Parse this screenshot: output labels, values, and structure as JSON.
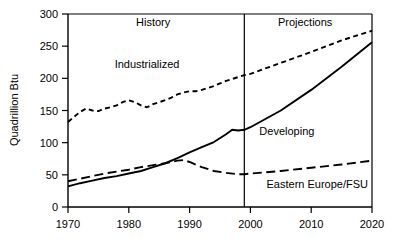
{
  "chart_data": {
    "type": "line",
    "title": "",
    "xlabel": "",
    "ylabel": "Quadrillion Btu",
    "xlim": [
      1970,
      2020
    ],
    "ylim": [
      0,
      300
    ],
    "grid": false,
    "legend_position": "inline-annotations",
    "xticks": [
      "1970",
      "1980",
      "1990",
      "2000",
      "2010",
      "2020"
    ],
    "xtick_values": [
      1970,
      1980,
      1990,
      2000,
      2010,
      2020
    ],
    "yticks": [
      "0",
      "50",
      "100",
      "150",
      "200",
      "250",
      "300"
    ],
    "ytick_values": [
      0,
      50,
      100,
      150,
      200,
      250,
      300
    ],
    "annotations": [
      {
        "text": "History",
        "x": 1984,
        "y": 288
      },
      {
        "text": "Projections",
        "x": 2009,
        "y": 288
      },
      {
        "text": "Industrialized",
        "x": 1983,
        "y": 222
      },
      {
        "text": "Developing",
        "x": 2006,
        "y": 118
      },
      {
        "text": "Eastern Europe/FSU",
        "x": 2011,
        "y": 35
      }
    ],
    "divider": {
      "x": 1999,
      "label": "history-projection-divider"
    },
    "series": [
      {
        "name": "Industrialized",
        "style": "short-dashed",
        "x": [
          1970,
          1971,
          1972,
          1973,
          1974,
          1975,
          1976,
          1977,
          1978,
          1979,
          1980,
          1981,
          1982,
          1983,
          1984,
          1985,
          1986,
          1987,
          1988,
          1989,
          1990,
          1991,
          1992,
          1993,
          1994,
          1995,
          1996,
          1997,
          1998,
          1999,
          2000,
          2005,
          2010,
          2015,
          2020
        ],
        "values": [
          132,
          140,
          148,
          153,
          150,
          149,
          153,
          155,
          158,
          163,
          166,
          163,
          158,
          155,
          160,
          163,
          166,
          170,
          175,
          178,
          180,
          180,
          182,
          185,
          188,
          192,
          196,
          199,
          202,
          205,
          207,
          224,
          241,
          259,
          274
        ]
      },
      {
        "name": "Developing",
        "style": "solid",
        "x": [
          1970,
          1972,
          1974,
          1976,
          1978,
          1980,
          1982,
          1984,
          1986,
          1988,
          1990,
          1992,
          1994,
          1996,
          1997,
          1998,
          1999,
          2000,
          2005,
          2010,
          2015,
          2020
        ],
        "values": [
          32,
          37,
          41,
          45,
          48,
          52,
          56,
          62,
          68,
          76,
          85,
          93,
          101,
          113,
          120,
          119,
          120,
          124,
          150,
          182,
          218,
          256
        ]
      },
      {
        "name": "Eastern Europe/FSU",
        "style": "long-dashed",
        "x": [
          1970,
          1972,
          1974,
          1976,
          1978,
          1980,
          1982,
          1984,
          1986,
          1988,
          1989,
          1990,
          1992,
          1994,
          1996,
          1998,
          1999,
          2000,
          2005,
          2010,
          2015,
          2020
        ],
        "values": [
          40,
          44,
          48,
          52,
          55,
          58,
          62,
          65,
          68,
          72,
          73,
          70,
          62,
          56,
          53,
          51,
          51,
          52,
          56,
          61,
          66,
          72
        ]
      }
    ]
  }
}
